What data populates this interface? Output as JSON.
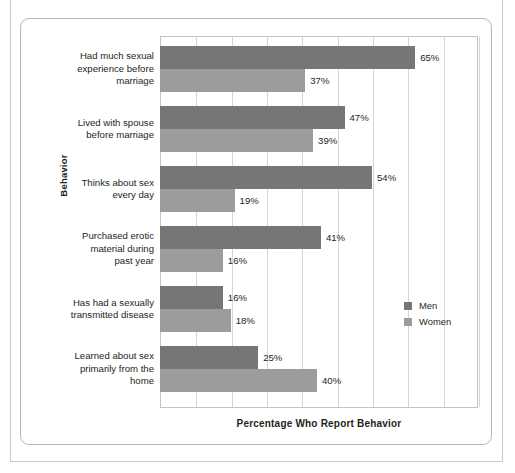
{
  "figure": {
    "x_axis_title": "Percentage Who Report Behavior",
    "y_axis_title": "Behavior"
  },
  "legend": {
    "items": [
      {
        "label": "Men",
        "color": "#767676",
        "swatch_name": "legend-swatch-men"
      },
      {
        "label": "Women",
        "color": "#9c9c9c",
        "swatch_name": "legend-swatch-women"
      }
    ]
  },
  "chart_data": {
    "type": "bar",
    "orientation": "horizontal",
    "title": "",
    "xlabel": "Percentage Who Report Behavior",
    "ylabel": "Behavior",
    "xlim": [
      0,
      81
    ],
    "grid": true,
    "gridline_values": [
      0,
      9,
      18,
      27,
      36,
      45,
      54,
      63,
      72,
      81
    ],
    "legend_position": "right-middle",
    "categories": [
      "Had much sexual experience before marriage",
      "Lived with spouse before marriage",
      "Thinks about sex every day",
      "Purchased erotic material during past year",
      "Has had a sexually transmitted disease",
      "Learned about sex primarily from the home"
    ],
    "category_lines": [
      [
        "Had much sexual",
        "experience before",
        "marriage"
      ],
      [
        "Lived with spouse",
        "before marriage"
      ],
      [
        "Thinks about sex",
        "every day"
      ],
      [
        "Purchased erotic",
        "material during",
        "past year"
      ],
      [
        "Has had a sexually",
        "transmitted disease"
      ],
      [
        "Learned about sex",
        "primarily from the",
        "home"
      ]
    ],
    "series": [
      {
        "name": "Men",
        "color": "#767676",
        "values": [
          65,
          47,
          54,
          41,
          16,
          25
        ]
      },
      {
        "name": "Women",
        "color": "#9c9c9c",
        "values": [
          37,
          39,
          19,
          16,
          18,
          40
        ]
      }
    ],
    "data_labels": [
      [
        "65%",
        "37%"
      ],
      [
        "47%",
        "39%"
      ],
      [
        "54%",
        "19%"
      ],
      [
        "41%",
        "16%"
      ],
      [
        "16%",
        "18%"
      ],
      [
        "25%",
        "40%"
      ]
    ]
  }
}
